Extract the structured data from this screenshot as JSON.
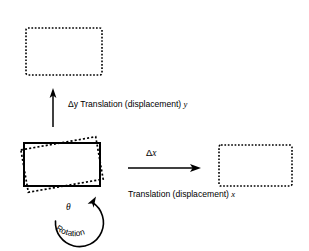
{
  "figure": {
    "type": "diagram",
    "background_color": "#ffffff",
    "stroke_color": "#000000"
  },
  "shapes": {
    "original_rect": {
      "name": "original-rectangle",
      "style": "solid",
      "x": 24,
      "y": 143,
      "width": 76,
      "height": 43
    },
    "rotated_rect": {
      "name": "rotated-rectangle",
      "style": "dashed",
      "x": 24,
      "y": 143,
      "width": 76,
      "height": 43,
      "rotation_degrees": -10
    },
    "translated_up_rect": {
      "name": "translated-y-rectangle",
      "style": "dashed",
      "x": 26,
      "y": 28,
      "width": 76,
      "height": 47
    },
    "translated_right_rect": {
      "name": "translated-x-rectangle",
      "style": "dashed",
      "x": 219,
      "y": 145,
      "width": 73,
      "height": 41
    }
  },
  "arrows": {
    "y_translation": {
      "name": "translation-y-arrow",
      "direction": "up",
      "x": 53,
      "y_start": 127,
      "y_end": 90
    },
    "x_translation": {
      "name": "translation-x-arrow",
      "direction": "right",
      "y": 168,
      "x_start": 128,
      "x_end": 200
    },
    "rotation": {
      "name": "rotation-arc-arrow",
      "direction": "counterclockwise-to-clockwise",
      "center_x": 78,
      "center_y": 214,
      "radius": 24
    }
  },
  "labels": {
    "delta_y_translation": {
      "delta_symbol": "Δy",
      "text": " Translation (displacement) ",
      "axis": "y",
      "full": "Δy Translation (displacement) y"
    },
    "delta_x": {
      "delta_symbol": "Δ",
      "axis": "x",
      "full": "Δx"
    },
    "translation_x_caption": {
      "text": "Translation (displacement) ",
      "axis": "x",
      "full": "Translation (displacement) x"
    },
    "theta": {
      "symbol": "θ"
    },
    "rotation": {
      "text": "Rotation"
    }
  }
}
